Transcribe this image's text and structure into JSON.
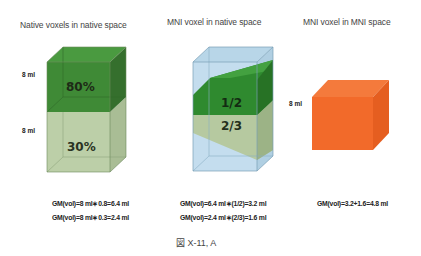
{
  "panels": [
    {
      "title": "Native voxels in native space",
      "volume_labels": [
        "8 ml",
        "8 ml"
      ],
      "segments": [
        {
          "label": "80%",
          "color": "#3f8a36"
        },
        {
          "label": "30%",
          "color": "#b9cda6"
        }
      ],
      "formulas": [
        "GM(vol)=8 ml∗0.8=6.4 ml",
        "GM(vol)=8 ml∗0.3=2.4 ml"
      ]
    },
    {
      "title": "MNI voxel in native space",
      "segments": [
        {
          "label": "1/2",
          "color": "#2f8a2f"
        },
        {
          "label": "2/3",
          "color": "#b6c9a0"
        }
      ],
      "background_color": "#c4ddee",
      "formulas": [
        "GM(vol)=6.4 ml∗(1/2)=3.2 ml",
        "GM(vol)=2.4 ml∗(2/3)=1.6 ml"
      ]
    },
    {
      "title": "MNI voxel in MNI space",
      "volume_labels": [
        "8 ml"
      ],
      "color": "#f26a2a",
      "formulas": [
        "GM(vol)=3.2+1.6=4.8 ml"
      ]
    }
  ],
  "caption": "図 X-11, A"
}
